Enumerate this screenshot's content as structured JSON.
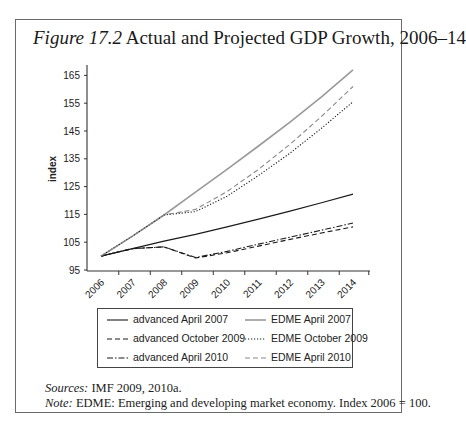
{
  "figure": {
    "label": "Figure 17.2",
    "title": "Actual and Projected GDP Growth, 2006–14",
    "sources_label": "Sources:",
    "sources_text": "IMF 2009, 2010a.",
    "note_label": "Note:",
    "note_text": "EDME: Emerging and developing market economy. Index 2006 = 100."
  },
  "chart_data": {
    "type": "line",
    "title": "Actual and Projected GDP Growth, 2006–14",
    "xlabel": "",
    "ylabel": "index",
    "x": [
      "2006",
      "2007",
      "2008",
      "2009",
      "2010",
      "2011",
      "2012",
      "2013",
      "2014"
    ],
    "yticks": [
      95,
      105,
      115,
      125,
      135,
      145,
      155,
      165
    ],
    "ylim": [
      95,
      168
    ],
    "grid": false,
    "legend_position": "bottom",
    "series": [
      {
        "name": "advanced April 2007",
        "style": "solid",
        "color": "#1a1a1a",
        "values": [
          100,
          102.7,
          105.4,
          107.8,
          110.5,
          113.3,
          116.2,
          119.2,
          122.3
        ]
      },
      {
        "name": "EDME April 2007",
        "style": "solid",
        "color": "#9a9a9a",
        "values": [
          100,
          107.2,
          114.8,
          123,
          131.2,
          139.6,
          148.2,
          157.3,
          167
        ]
      },
      {
        "name": "advanced October 2009",
        "style": "dashed",
        "color": "#1a1a1a",
        "values": [
          100,
          102.7,
          103.3,
          99.3,
          101.2,
          103.6,
          106,
          108.3,
          110.5
        ]
      },
      {
        "name": "EDME October 2009",
        "style": "dotted",
        "color": "#1a1a1a",
        "values": [
          100,
          107.2,
          114.8,
          116,
          121.5,
          129,
          137,
          146,
          155.5
        ]
      },
      {
        "name": "advanced April 2010",
        "style": "dashdot",
        "color": "#1a1a1a",
        "values": [
          100,
          102.7,
          103.3,
          99.5,
          101.7,
          104.3,
          106.8,
          109.3,
          111.9
        ]
      },
      {
        "name": "EDME April 2010",
        "style": "dashed",
        "color": "#8a8a8a",
        "values": [
          100,
          107.2,
          114.8,
          116.8,
          123.2,
          131.2,
          140.2,
          150.2,
          161
        ]
      }
    ]
  }
}
